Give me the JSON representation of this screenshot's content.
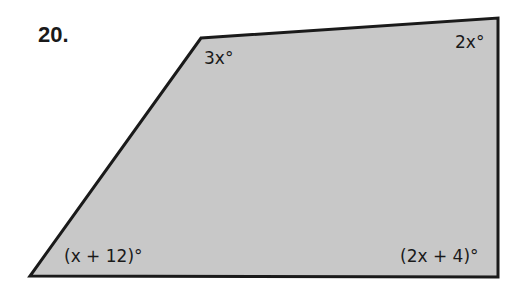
{
  "problem_number": "20.",
  "figure": {
    "type": "quadrilateral",
    "fill_color": "#c8c8c8",
    "stroke_color": "#1a1a1a",
    "vertices": {
      "top_left": [
        201,
        38
      ],
      "top_right": [
        498,
        18
      ],
      "bottom_right": [
        498,
        277
      ],
      "bottom_left": [
        30,
        276
      ]
    },
    "angles": {
      "top_left": "3x°",
      "top_right": "2x°",
      "bottom_left": "(x + 12)°",
      "bottom_right": "(2x + 4)°"
    }
  }
}
